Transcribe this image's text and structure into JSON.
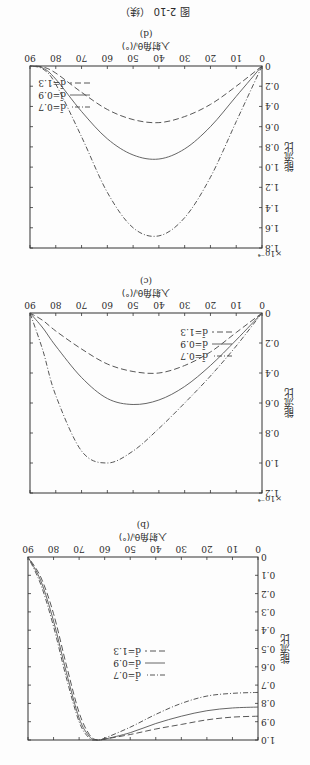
{
  "figure": {
    "caption": "图 2-10 （续）",
    "orientation": "rotated 180°"
  },
  "legend": [
    {
      "label": "d̄=0.7",
      "style": "dash-dot"
    },
    {
      "label": "d̄=0.9",
      "style": "solid"
    },
    {
      "label": "d̄=1.3",
      "style": "dashed"
    }
  ],
  "chart_data": [
    {
      "panel": "(b)",
      "type": "line",
      "xlabel": "入射角θᵢ/(°)",
      "ylabel": "能流比",
      "xlim": [
        0,
        90
      ],
      "ylim": [
        0,
        1.0
      ],
      "xticks": [
        0,
        10,
        20,
        30,
        40,
        50,
        60,
        70,
        80,
        90
      ],
      "yticks": [
        0.1,
        0.2,
        0.3,
        0.4,
        0.5,
        0.6,
        0.7,
        0.8,
        0.9,
        1.0
      ],
      "x": [
        0,
        10,
        20,
        30,
        40,
        50,
        60,
        63,
        66,
        70,
        75,
        80,
        85,
        90
      ],
      "series": [
        {
          "name": "d̄=0.7",
          "values": [
            0.74,
            0.745,
            0.76,
            0.8,
            0.86,
            0.93,
            0.99,
            1.0,
            0.99,
            0.9,
            0.66,
            0.38,
            0.15,
            0.0
          ]
        },
        {
          "name": "d̄=0.9",
          "values": [
            0.82,
            0.825,
            0.84,
            0.87,
            0.91,
            0.96,
            0.995,
            1.0,
            0.98,
            0.88,
            0.63,
            0.35,
            0.13,
            0.0
          ]
        },
        {
          "name": "d̄=1.3",
          "values": [
            0.87,
            0.875,
            0.89,
            0.915,
            0.94,
            0.97,
            0.995,
            1.0,
            0.97,
            0.85,
            0.59,
            0.31,
            0.11,
            0.0
          ]
        }
      ],
      "legend_position": "center"
    },
    {
      "panel": "(c)",
      "type": "line",
      "xlabel": "入射角θᵢ/(°)",
      "ylabel": "能流比",
      "y_scale_note": "×10⁻⁴",
      "xlim": [
        0,
        90
      ],
      "ylim": [
        0,
        1.2
      ],
      "xticks": [
        0,
        10,
        20,
        30,
        40,
        50,
        60,
        70,
        80,
        90
      ],
      "yticks": [
        0.2,
        0.4,
        0.6,
        0.8,
        1.0,
        1.2
      ],
      "x": [
        0,
        10,
        20,
        30,
        40,
        50,
        60,
        70,
        80,
        85,
        90
      ],
      "series": [
        {
          "name": "d̄=0.7",
          "values": [
            0.0,
            0.22,
            0.42,
            0.6,
            0.77,
            0.92,
            1.0,
            0.92,
            0.55,
            0.25,
            0.0
          ]
        },
        {
          "name": "d̄=0.9",
          "values": [
            0.0,
            0.18,
            0.35,
            0.49,
            0.58,
            0.61,
            0.57,
            0.43,
            0.22,
            0.1,
            0.0
          ]
        },
        {
          "name": "d̄=1.3",
          "values": [
            0.0,
            0.13,
            0.26,
            0.35,
            0.4,
            0.39,
            0.34,
            0.24,
            0.12,
            0.05,
            0.0
          ]
        }
      ],
      "legend_position": "lower right (rotated)"
    },
    {
      "panel": "(d)",
      "type": "line",
      "xlabel": "入射角θᵢ/(°)",
      "ylabel": "能流比",
      "y_scale_note": "×10⁻⁴",
      "xlim": [
        0,
        90
      ],
      "ylim": [
        0,
        1.8
      ],
      "xticks": [
        0,
        10,
        20,
        30,
        40,
        50,
        60,
        70,
        80,
        90
      ],
      "yticks": [
        0.2,
        0.4,
        0.6,
        0.8,
        1.0,
        1.2,
        1.4,
        1.6,
        1.8
      ],
      "x": [
        0,
        10,
        20,
        30,
        40,
        50,
        60,
        70,
        80,
        85,
        90
      ],
      "series": [
        {
          "name": "d̄=0.7",
          "values": [
            0.0,
            0.55,
            1.1,
            1.5,
            1.68,
            1.6,
            1.25,
            0.7,
            0.18,
            0.03,
            0.0
          ]
        },
        {
          "name": "d̄=0.9",
          "values": [
            0.0,
            0.3,
            0.6,
            0.82,
            0.92,
            0.88,
            0.72,
            0.45,
            0.13,
            0.02,
            0.0
          ]
        },
        {
          "name": "d̄=1.3",
          "values": [
            0.0,
            0.2,
            0.38,
            0.5,
            0.56,
            0.53,
            0.43,
            0.26,
            0.07,
            0.01,
            0.0
          ]
        }
      ],
      "legend_position": "lower left (rotated)"
    }
  ]
}
